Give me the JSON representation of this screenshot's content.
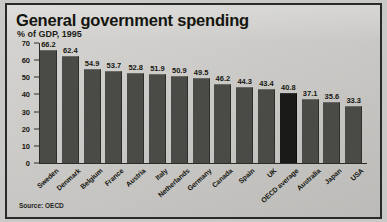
{
  "figure": {
    "title": "General government spending",
    "subtitle": "% of GDP, 1995",
    "source": "Source: OECD",
    "frame_color": "#2a2a28",
    "background_color": "#cccbc8",
    "bar_color": "#4a4a46",
    "highlight_bar_color": "#1a1a18"
  },
  "chart_data": {
    "type": "bar",
    "title": "General government spending",
    "subtitle": "% of GDP, 1995",
    "xlabel": "",
    "ylabel": "",
    "ylim": [
      0,
      70
    ],
    "yticks": [
      0,
      10,
      20,
      30,
      40,
      50,
      60,
      70
    ],
    "grid": false,
    "legend": null,
    "source": "Source: OECD",
    "highlight_category": "OECD average",
    "categories": [
      "Sweden",
      "Denmark",
      "Belgium",
      "France",
      "Austria",
      "Italy",
      "Netherlands",
      "Germany",
      "Canada",
      "Spain",
      "UK",
      "OECD average",
      "Australia",
      "Japan",
      "USA"
    ],
    "values": [
      66.2,
      62.4,
      54.9,
      53.7,
      52.8,
      51.9,
      50.9,
      49.5,
      46.2,
      44.3,
      43.4,
      40.8,
      37.1,
      35.6,
      33.3
    ]
  }
}
